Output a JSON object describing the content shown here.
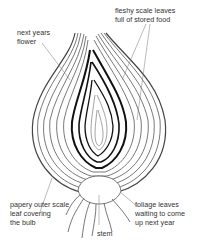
{
  "diagram": {
    "labels": {
      "scale_leaves": "fleshy scale leaves\nfull of stored food",
      "flower": "next years\nflower",
      "outer_scale": "papery outer scale\nleaf covering\nthe bulb",
      "foliage": "foliage leaves\nwaiting to come\nup next year",
      "stem": "stem"
    }
  }
}
